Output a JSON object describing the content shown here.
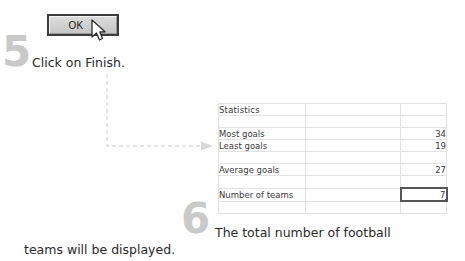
{
  "steps": [
    {
      "numeral": "5",
      "instruction": "Click on Finish."
    },
    {
      "numeral": "6",
      "instruction_line1": "The total number of football",
      "instruction_line2": "teams will be displayed."
    }
  ],
  "dialog": {
    "ok_button_label": "OK",
    "cursor_icon": "mouse-pointer-icon"
  },
  "connector": {
    "icon": "dashed-arrow-icon"
  },
  "table": {
    "title": "Statistics",
    "rows": [
      {
        "label": "Most goals",
        "value": "34"
      },
      {
        "label": "Least goals",
        "value": "19"
      },
      {
        "label": "Average goals",
        "value": "27"
      },
      {
        "label": "Number of teams",
        "value": "7"
      }
    ],
    "selected_cell_value": "7"
  },
  "colors": {
    "numeral": "#c9c9c9",
    "grid_line": "#e2e2e2",
    "selected_border": "#555555",
    "text": "#3a3a3a",
    "button_face": "#d3d3d3"
  }
}
